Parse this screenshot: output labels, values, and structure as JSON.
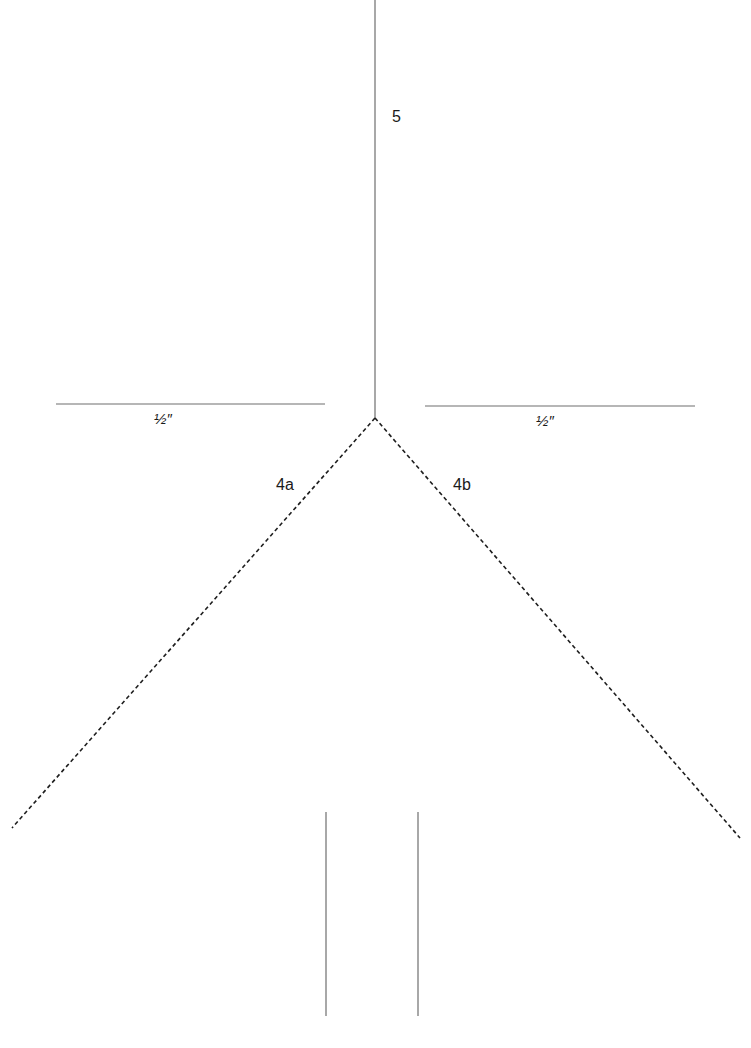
{
  "diagram": {
    "background": "#ffffff",
    "line_color": "#6e6e6e",
    "dash_color": "#1e1e1e",
    "labels": {
      "fold_5": "5",
      "half_inch_left": "½″",
      "half_inch_right": "½″",
      "fold_4a": "4a",
      "fold_4b": "4b"
    },
    "lines": {
      "center_vertical": {
        "x1": 375,
        "y1": 0,
        "x2": 375,
        "y2": 418,
        "style": "solid"
      },
      "left_horizontal": {
        "x1": 56,
        "y1": 404,
        "x2": 325,
        "y2": 404,
        "style": "solid"
      },
      "right_horizontal": {
        "x1": 425,
        "y1": 406,
        "x2": 695,
        "y2": 406,
        "style": "solid"
      },
      "fold_4a_dashed": {
        "x1": 375,
        "y1": 418,
        "x2": 12,
        "y2": 828,
        "style": "dashed"
      },
      "fold_4b_dashed": {
        "x1": 375,
        "y1": 418,
        "x2": 740,
        "y2": 838,
        "style": "dashed"
      },
      "bottom_left_vertical": {
        "x1": 326,
        "y1": 812,
        "x2": 326,
        "y2": 1016,
        "style": "solid"
      },
      "bottom_right_vertical": {
        "x1": 418,
        "y1": 812,
        "x2": 418,
        "y2": 1016,
        "style": "solid"
      }
    }
  }
}
